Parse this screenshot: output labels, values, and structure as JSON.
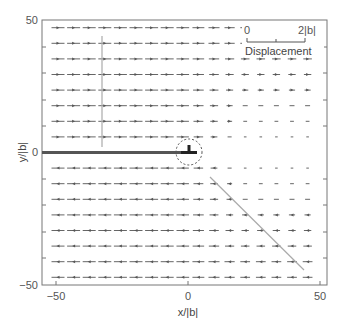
{
  "chart_data": {
    "type": "quiver",
    "title": "",
    "xlabel": "x/|b|",
    "ylabel": "y/|b|",
    "xlim": [
      -55,
      52
    ],
    "ylim": [
      -50,
      50
    ],
    "x_ticks": [
      -50,
      0,
      50
    ],
    "y_ticks": [
      -50,
      0,
      50
    ],
    "grid": false,
    "dislocation": {
      "x": 0,
      "y": 0,
      "symbol": "⊥",
      "core_circle_radius": 6
    },
    "slip_plane": {
      "x_from": -55,
      "x_to": 0,
      "y": 0
    },
    "scale_bar": {
      "label_start": "0",
      "label_end": "2|b|",
      "caption": "Displacement"
    },
    "guide_lines": [
      {
        "name": "upper-vertical-line",
        "points": [
          [
            -33,
            44
          ],
          [
            -33,
            3
          ]
        ]
      },
      {
        "name": "lower-diagonal-line",
        "points": [
          [
            8,
            -9
          ],
          [
            44,
            -44
          ]
        ]
      }
    ],
    "series": [
      {
        "name": "upper half-plane",
        "direction": "+x",
        "magnitude_left": 1.0,
        "magnitude_right": 0.35
      },
      {
        "name": "lower half-plane",
        "direction": "-x",
        "magnitude_left": 1.0,
        "magnitude_right": 0.35
      }
    ]
  },
  "labels": {
    "x_tick_neg": "−50",
    "x_tick_zero": "0",
    "x_tick_pos": "50",
    "y_tick_neg": "−50",
    "y_tick_zero": "0",
    "y_tick_pos": "50",
    "xlabel": "x/|b|",
    "ylabel": "y/|b|",
    "scale_start": "0",
    "scale_end": "2|b|",
    "scale_caption": "Displacement"
  }
}
